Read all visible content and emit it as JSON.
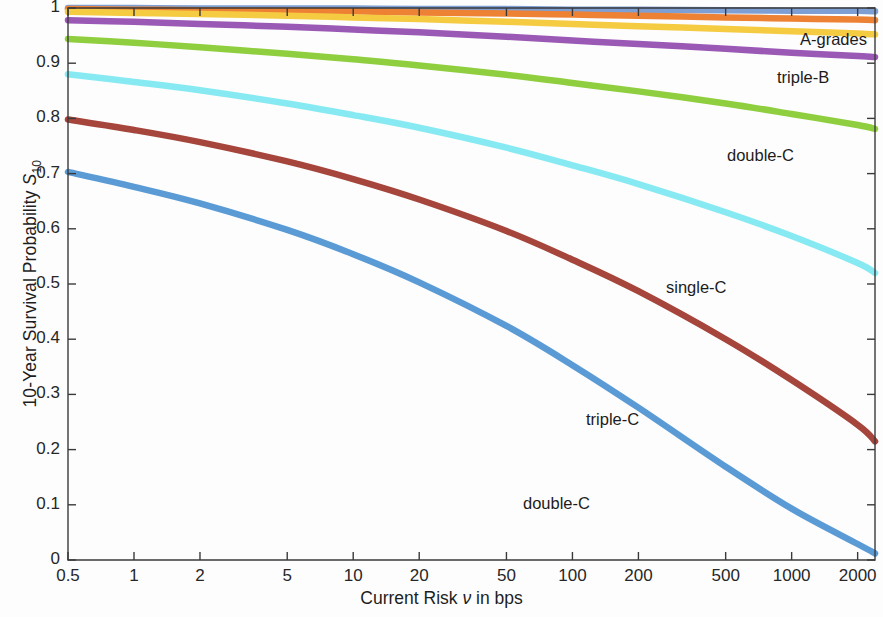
{
  "axes": {
    "ylabel_prefix": "10-Year Survival Probability ",
    "ylabel_symbol": "S",
    "ylabel_subscript": "10",
    "xlabel_prefix": "Current Risk ",
    "xlabel_symbol": "ν",
    "xlabel_suffix": " in bps"
  },
  "yticks": [
    "0",
    "0.1",
    "0.2",
    "0.3",
    "0.4",
    "0.5",
    "0.6",
    "0.7",
    "0.8",
    "0.9",
    "1"
  ],
  "xticks": [
    "0.5",
    "1",
    "2",
    "5",
    "10",
    "20",
    "50",
    "100",
    "200",
    "500",
    "1000",
    "2000"
  ],
  "annotations": [
    {
      "key": "a_grades",
      "text": "A-grades"
    },
    {
      "key": "triple_b",
      "text": "triple-B"
    },
    {
      "key": "double_c1",
      "text": "double-C"
    },
    {
      "key": "single_c",
      "text": "single-C"
    },
    {
      "key": "triple_c",
      "text": "triple-C"
    },
    {
      "key": "double_c2",
      "text": "double-C"
    }
  ],
  "colors": {
    "steelblue": "#7e9fd4",
    "orange": "#ee8234",
    "yellow": "#f5cb42",
    "purple": "#9b59b6",
    "green": "#8fce3f",
    "cyan": "#87eaf2",
    "brown": "#a5453b",
    "blue": "#5b9bd5",
    "axis": "#3a3a3a",
    "background": "#fdfdfd"
  },
  "chart_data": {
    "type": "line",
    "title": "",
    "xlabel": "Current Risk ν in bps",
    "ylabel": "10-Year Survival Probability S_10",
    "xscale": "log",
    "xlim": [
      0.5,
      2400
    ],
    "ylim": [
      0,
      1
    ],
    "grid": false,
    "legend": "in-plot annotations",
    "x": [
      0.5,
      1,
      2,
      5,
      10,
      20,
      50,
      100,
      200,
      500,
      1000,
      2000,
      2400
    ],
    "series": [
      {
        "name": "A-grades (upper)",
        "label": "A-grades",
        "color": "#7e9fd4",
        "values": [
          1.0,
          1.0,
          0.999,
          0.999,
          0.999,
          0.998,
          0.998,
          0.997,
          0.997,
          0.996,
          0.995,
          0.995,
          0.994
        ]
      },
      {
        "name": "A-grades (mid)",
        "label": "A-grades",
        "color": "#ee8234",
        "values": [
          0.998,
          0.997,
          0.996,
          0.995,
          0.994,
          0.992,
          0.99,
          0.988,
          0.986,
          0.983,
          0.981,
          0.979,
          0.978
        ]
      },
      {
        "name": "A-grades (lower)",
        "label": "A-grades",
        "color": "#f5cb42",
        "values": [
          0.993,
          0.991,
          0.989,
          0.986,
          0.983,
          0.98,
          0.975,
          0.971,
          0.967,
          0.962,
          0.958,
          0.954,
          0.952
        ]
      },
      {
        "name": "triple-B",
        "label": "triple-B",
        "color": "#9b59b6",
        "values": [
          0.978,
          0.975,
          0.971,
          0.966,
          0.961,
          0.956,
          0.948,
          0.941,
          0.935,
          0.926,
          0.919,
          0.913,
          0.911
        ]
      },
      {
        "name": "double-C (green)",
        "label": "double-C",
        "color": "#8fce3f",
        "values": [
          0.944,
          0.937,
          0.929,
          0.917,
          0.907,
          0.896,
          0.879,
          0.864,
          0.849,
          0.827,
          0.808,
          0.788,
          0.781
        ]
      },
      {
        "name": "single-C",
        "label": "single-C",
        "color": "#87eaf2",
        "values": [
          0.88,
          0.866,
          0.851,
          0.827,
          0.806,
          0.783,
          0.747,
          0.715,
          0.681,
          0.63,
          0.587,
          0.538,
          0.52
        ]
      },
      {
        "name": "triple-C",
        "label": "triple-C",
        "color": "#a5453b",
        "values": [
          0.798,
          0.779,
          0.757,
          0.722,
          0.69,
          0.653,
          0.596,
          0.544,
          0.487,
          0.4,
          0.326,
          0.245,
          0.215
        ]
      },
      {
        "name": "double-C (blue)",
        "label": "double-C",
        "color": "#5b9bd5",
        "values": [
          0.703,
          0.676,
          0.646,
          0.598,
          0.554,
          0.503,
          0.424,
          0.353,
          0.276,
          0.169,
          0.093,
          0.029,
          0.012
        ]
      }
    ]
  }
}
